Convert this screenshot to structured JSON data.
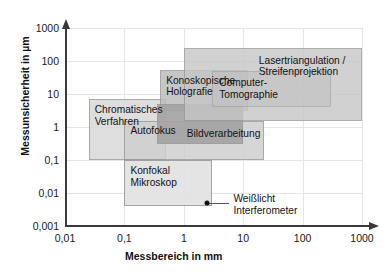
{
  "chart_data": {
    "type": "scatter",
    "title": "",
    "xlabel": "Messbereich in mm",
    "ylabel": "Messunsicherheit in µm",
    "xscale": "log",
    "yscale": "log",
    "xlim": [
      0.01,
      1000
    ],
    "ylim": [
      0.001,
      1000
    ],
    "grid": true,
    "legend": "none",
    "xticks": [
      "0,01",
      "0,1",
      "1",
      "10",
      "100",
      "1000"
    ],
    "xtick_values": [
      0.01,
      0.1,
      1,
      10,
      100,
      1000
    ],
    "yticks": [
      "0,001",
      "0,01",
      "0,1",
      "1",
      "10",
      "100",
      "1000"
    ],
    "ytick_values": [
      0.001,
      0.01,
      0.1,
      1,
      10,
      100,
      1000
    ],
    "regions": [
      {
        "name": "chromatisches-verfahren",
        "label": "Chromatisches\nVerfahren",
        "x_range": [
          0.025,
          0.5
        ],
        "y_range": [
          0.1,
          7
        ],
        "fill": "#d9d9d9",
        "opacity": 0.85
      },
      {
        "name": "autofokus",
        "label": "Autofokus",
        "x_range": [
          0.1,
          22
        ],
        "y_range": [
          0.1,
          1.5
        ],
        "fill": "#cfcfcf",
        "opacity": 0.85
      },
      {
        "name": "konfokal-mikroskop",
        "label": "Konfokal\nMikroskop",
        "x_range": [
          0.1,
          3
        ],
        "y_range": [
          0.004,
          0.1
        ],
        "fill": "#e2e2e2",
        "opacity": 0.9
      },
      {
        "name": "konoskopische-holografie",
        "label": "Konoskopische\nHolografie",
        "x_range": [
          0.4,
          12
        ],
        "y_range": [
          3,
          55
        ],
        "fill": "#bdbdbd",
        "opacity": 0.85
      },
      {
        "name": "bildverarbeitung",
        "label": "Bildverarbeitung",
        "x_range": [
          0.35,
          10
        ],
        "y_range": [
          0.3,
          5
        ],
        "fill": "#a3a3a3",
        "opacity": 0.9
      },
      {
        "name": "lasertriangulation-streifenprojektion",
        "label": "Lasertriangulation /\nStreifenprojektion",
        "x_range": [
          1,
          1000
        ],
        "y_range": [
          1.5,
          250
        ],
        "fill": "#c6c6c6",
        "opacity": 0.8
      },
      {
        "name": "computer-tomographie",
        "label": "Computer-\nTomographie",
        "x_range": [
          3,
          300
        ],
        "y_range": [
          4,
          50
        ],
        "fill": "#c0c0c0",
        "opacity": 0.55
      }
    ],
    "points": [
      {
        "name": "weisslicht-interferometer",
        "label": "Weißlicht\nInterferometer",
        "x": 2.5,
        "y": 0.005,
        "marker": "circle",
        "color": "#111111"
      }
    ]
  },
  "colors": {
    "axis": "#3a3a3a",
    "grid": "#e6e6e6",
    "text": "#121212",
    "background": "#ffffff"
  }
}
